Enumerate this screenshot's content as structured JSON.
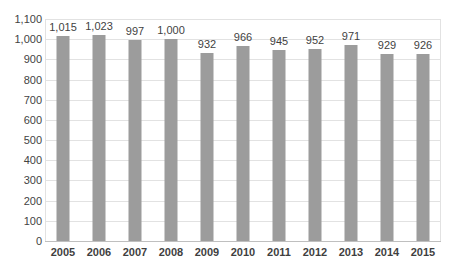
{
  "chart_data": {
    "type": "bar",
    "title": "",
    "subtitle": "",
    "xlabel": "",
    "ylabel": "",
    "categories": [
      "2005",
      "2006",
      "2007",
      "2008",
      "2009",
      "2010",
      "2011",
      "2012",
      "2013",
      "2014",
      "2015"
    ],
    "values": [
      1015,
      1023,
      997,
      1000,
      932,
      966,
      945,
      952,
      971,
      929,
      926
    ],
    "data_labels": [
      "1,015",
      "1,023",
      "997",
      "1,000",
      "932",
      "966",
      "945",
      "952",
      "971",
      "929",
      "926"
    ],
    "ylim": [
      0,
      1100
    ],
    "ytick_values": [
      0,
      100,
      200,
      300,
      400,
      500,
      600,
      700,
      800,
      900,
      1000,
      1100
    ],
    "ytick_labels": [
      "0",
      "100",
      "200",
      "300",
      "400",
      "500",
      "600",
      "700",
      "800",
      "900",
      "1,000",
      "1,100"
    ],
    "grid": true,
    "grid_axis": "y",
    "legend": false,
    "legend_position": "none",
    "series_name": "",
    "bar_color": "#9c9c9c",
    "grid_color": "#e2e2e2",
    "axis_color": "#bfbfbf",
    "background_color": "#ffffff",
    "data_label_color": "#3f3f3f"
  }
}
